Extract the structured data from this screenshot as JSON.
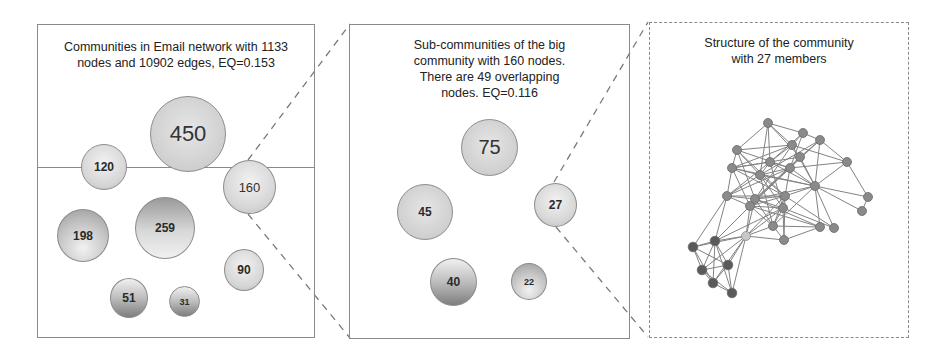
{
  "figure": {
    "panels": [
      {
        "id": "email-network",
        "title_lines": [
          "Communities in Email network with 1133",
          "nodes and 10902 edges, EQ=0.153"
        ],
        "border": "solid",
        "communities": [
          {
            "label": "450",
            "size": 450
          },
          {
            "label": "120",
            "size": 120
          },
          {
            "label": "160",
            "size": 160
          },
          {
            "label": "198",
            "size": 198
          },
          {
            "label": "259",
            "size": 259
          },
          {
            "label": "90",
            "size": 90
          },
          {
            "label": "51",
            "size": 51
          },
          {
            "label": "31",
            "size": 31
          }
        ]
      },
      {
        "id": "sub-communities",
        "title_lines": [
          "Sub-communities of the big",
          "community with 160 nodes.",
          "There are 49 overlapping",
          "nodes. EQ=0.116"
        ],
        "border": "solid",
        "communities": [
          {
            "label": "75",
            "size": 75
          },
          {
            "label": "45",
            "size": 45
          },
          {
            "label": "27",
            "size": 27
          },
          {
            "label": "40",
            "size": 40
          },
          {
            "label": "22",
            "size": 22
          }
        ]
      },
      {
        "id": "community-structure",
        "title_lines": [
          "Structure of the community",
          "with 27 members"
        ],
        "border": "dashed",
        "graph": {
          "node_count": 27,
          "node_color": "#8a8a8a",
          "highlight_node_color": "#c8c8c8",
          "edge_color": "#6e6e6e"
        }
      }
    ],
    "connectors": [
      {
        "from": "community-160",
        "to": "sub-communities",
        "style": "dashed"
      },
      {
        "from": "community-27",
        "to": "community-structure",
        "style": "dashed"
      }
    ],
    "colors": {
      "border": "#8a8a8a",
      "connector": "#7a7a7a",
      "text": "#222222"
    }
  }
}
